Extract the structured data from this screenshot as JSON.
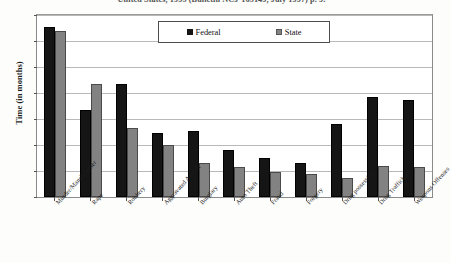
{
  "caption": "United States, 1995 (Bulletin NCJ-165149, July 1997) p. 9.",
  "axis": {
    "ylabel": "Time (in months)",
    "yticks": [
      "0",
      "20",
      "40",
      "60",
      "80",
      "100",
      "120",
      "140"
    ]
  },
  "legend": {
    "items": [
      {
        "label": "Federal",
        "color": "#151515"
      },
      {
        "label": "State",
        "color": "#828282"
      }
    ]
  },
  "chart_data": {
    "type": "bar",
    "title": "United States, 1995 (Bulletin NCJ-165149, July 1997) p. 9.",
    "xlabel": "",
    "ylabel": "Time (in months)",
    "ylim": [
      0,
      140
    ],
    "ytick_step": 20,
    "grid": true,
    "legend_position": "top-center-inside",
    "categories": [
      "Murder/Manslaughter",
      "Rape",
      "Robbery",
      "Aggravated Assault",
      "Burglary",
      "Auto Theft",
      "Fraud",
      "Forgery",
      "Drug possession",
      "Drug Trafficking",
      "Weapons Offenses"
    ],
    "series": [
      {
        "name": "Federal",
        "color": "#151515",
        "values": [
          131,
          67,
          87,
          49,
          51,
          36,
          30,
          26,
          56,
          77,
          75
        ]
      },
      {
        "name": "State",
        "color": "#828282",
        "values": [
          128,
          87,
          53,
          40,
          26,
          23,
          19,
          18,
          15,
          24,
          23
        ]
      }
    ]
  }
}
